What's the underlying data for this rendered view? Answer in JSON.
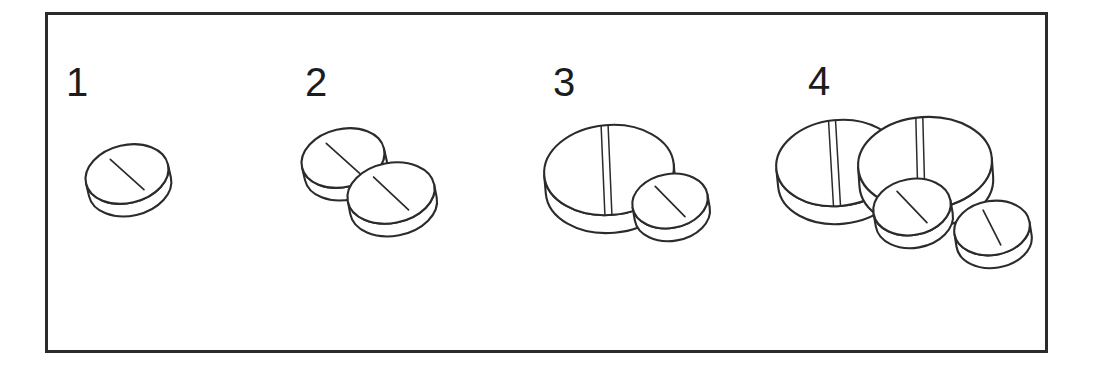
{
  "figure": {
    "kind": "line-art-illustration",
    "background_color": "#ffffff",
    "ink_color": "#2b2b2b",
    "frame": {
      "name": "illustration-border",
      "x": 46,
      "y": 13,
      "width": 1001,
      "height": 339,
      "stroke_color": "#2b2b2b",
      "stroke_width": 3
    },
    "groups": [
      {
        "label": "1",
        "label_x": 66,
        "label_y": 96,
        "tablet_count": 1,
        "description": "one small round single-scored tablet",
        "tablets": [
          {
            "name": "small-tablet",
            "shape": "round",
            "score": "single-diagonal",
            "cx": 127,
            "cy": 174,
            "rx": 42,
            "ry": 29,
            "rotate": -13,
            "thickness": 15
          }
        ]
      },
      {
        "label": "2",
        "label_x": 305,
        "label_y": 96,
        "tablet_count": 2,
        "description": "two small round single-scored tablets overlapping",
        "tablets": [
          {
            "name": "small-tablet",
            "shape": "round",
            "score": "single-diagonal",
            "cx": 343,
            "cy": 158,
            "rx": 42,
            "ry": 29,
            "rotate": -13,
            "thickness": 15
          },
          {
            "name": "small-tablet",
            "shape": "round",
            "score": "single-diagonal",
            "cx": 391,
            "cy": 193,
            "rx": 44,
            "ry": 30,
            "rotate": -11,
            "thickness": 15
          }
        ]
      },
      {
        "label": "3",
        "label_x": 553,
        "label_y": 96,
        "tablet_count": 2,
        "description": "one large double-scored tablet plus one small round single-scored tablet",
        "tablets": [
          {
            "name": "large-tablet",
            "shape": "round-large",
            "score": "double-vertical",
            "cx": 609,
            "cy": 170,
            "rx": 65,
            "ry": 45,
            "rotate": -5,
            "thickness": 20
          },
          {
            "name": "small-tablet",
            "shape": "round",
            "score": "single-diagonal",
            "cx": 670,
            "cy": 201,
            "rx": 38,
            "ry": 27,
            "rotate": -10,
            "thickness": 15
          }
        ]
      },
      {
        "label": "4",
        "label_x": 808,
        "label_y": 95,
        "tablet_count": 4,
        "description": "two large double-scored tablets plus two small round single-scored tablets",
        "tablets": [
          {
            "name": "large-tablet",
            "shape": "round-large",
            "score": "double-vertical",
            "cx": 838,
            "cy": 163,
            "rx": 62,
            "ry": 43,
            "rotate": -6,
            "thickness": 20
          },
          {
            "name": "large-tablet",
            "shape": "round-large",
            "score": "double-vertical",
            "cx": 925,
            "cy": 163,
            "rx": 67,
            "ry": 46,
            "rotate": -4,
            "thickness": 20
          },
          {
            "name": "small-tablet",
            "shape": "round",
            "score": "single-diagonal",
            "cx": 912,
            "cy": 207,
            "rx": 39,
            "ry": 28,
            "rotate": -10,
            "thickness": 15
          },
          {
            "name": "small-tablet",
            "shape": "round",
            "score": "single-diagonal",
            "cx": 992,
            "cy": 228,
            "rx": 38,
            "ry": 27,
            "rotate": -9,
            "thickness": 15
          }
        ]
      }
    ]
  }
}
